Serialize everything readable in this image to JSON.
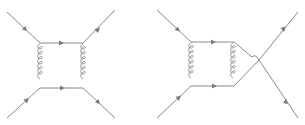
{
  "diagrams": [
    {
      "id": "box-diagram",
      "description": "Feynman box diagram with two fermion lines exchanging two gluons",
      "colors": {
        "line": "#8a8a8a",
        "arrow": "#7a7a7a",
        "background": "#ffffff"
      },
      "fermion_lines": [
        {
          "name": "incoming-top-left",
          "from": [
            7,
            12
          ],
          "to": [
            40,
            43
          ]
        },
        {
          "name": "box-top",
          "from": [
            40,
            43
          ],
          "to": [
            83,
            43
          ]
        },
        {
          "name": "outgoing-top-right",
          "from": [
            83,
            43
          ],
          "to": [
            115,
            10
          ]
        },
        {
          "name": "incoming-bottom-left",
          "from": [
            7,
            118
          ],
          "to": [
            40,
            88
          ]
        },
        {
          "name": "box-bottom",
          "from": [
            40,
            88
          ],
          "to": [
            83,
            88
          ]
        },
        {
          "name": "outgoing-bottom-right",
          "from": [
            83,
            88
          ],
          "to": [
            115,
            118
          ]
        }
      ],
      "gluon_lines": [
        {
          "name": "gluon-left",
          "x": 40,
          "y1": 43,
          "y2": 88
        },
        {
          "name": "gluon-right",
          "x": 83,
          "y1": 43,
          "y2": 88
        }
      ]
    },
    {
      "id": "crossed-box-diagram",
      "description": "Feynman box diagram with crossed outgoing fermion lines",
      "colors": {
        "line": "#8a8a8a",
        "arrow": "#7a7a7a",
        "background": "#ffffff"
      },
      "fermion_lines": [
        {
          "name": "incoming-top-left",
          "from": [
            157,
            10
          ],
          "to": [
            191,
            42
          ]
        },
        {
          "name": "box-top",
          "from": [
            191,
            42
          ],
          "to": [
            234,
            42
          ]
        },
        {
          "name": "incoming-bottom-left",
          "from": [
            157,
            118
          ],
          "to": [
            191,
            86
          ]
        },
        {
          "name": "box-bottom",
          "from": [
            191,
            86
          ],
          "to": [
            234,
            86
          ]
        },
        {
          "name": "crossing-from-top",
          "from": [
            234,
            42
          ],
          "to": [
            259,
            60
          ]
        },
        {
          "name": "crossing-from-bottom",
          "from": [
            234,
            86
          ],
          "to": [
            259,
            60
          ]
        },
        {
          "name": "outgoing-top-right",
          "from": [
            259,
            60
          ],
          "to": [
            298,
            12
          ]
        },
        {
          "name": "outgoing-bottom-right",
          "from": [
            259,
            60
          ],
          "to": [
            298,
            118
          ]
        }
      ],
      "gluon_lines": [
        {
          "name": "gluon-left",
          "x": 191,
          "y1": 42,
          "y2": 86
        },
        {
          "name": "gluon-right",
          "x": 233,
          "y1": 42,
          "y2": 86
        }
      ]
    }
  ]
}
